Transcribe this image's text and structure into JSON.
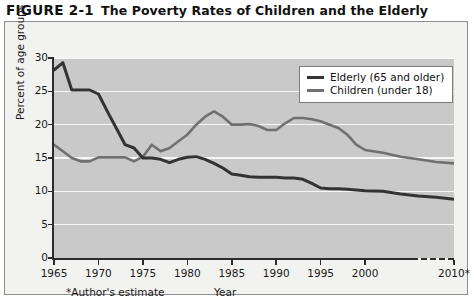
{
  "figure": {
    "number": "FIGURE 2-1",
    "name": "The Poverty Rates of Children and the Elderly"
  },
  "axes": {
    "ylabel": "Percent of age groups",
    "xlabel": "Year",
    "footnote": "*Author's estimate",
    "yticks": [
      "30",
      "25",
      "20",
      "15",
      "10",
      "5",
      "0"
    ],
    "xticks": [
      "1965",
      "1970",
      "1975",
      "1980",
      "1985",
      "1990",
      "1995",
      "2000",
      "2010*"
    ]
  },
  "legend": {
    "items": [
      {
        "label": "Elderly (65 and older)",
        "color": "#333333"
      },
      {
        "label": "Children (under 18)",
        "color": "#707070"
      }
    ]
  },
  "chart_data": {
    "type": "line",
    "title": "The Poverty Rates of Children and the Elderly",
    "xlabel": "Year",
    "ylabel": "Percent of age groups",
    "xlim": [
      1965,
      2010
    ],
    "ylim": [
      0,
      30
    ],
    "ytick_step": 5,
    "grid": "horizontal",
    "legend_position": "top-right",
    "annotations": [
      "*Author's estimate"
    ],
    "x": [
      1965,
      1966,
      1967,
      1968,
      1969,
      1970,
      1971,
      1972,
      1973,
      1974,
      1975,
      1976,
      1977,
      1978,
      1979,
      1980,
      1981,
      1982,
      1983,
      1984,
      1985,
      1986,
      1987,
      1988,
      1989,
      1990,
      1991,
      1992,
      1993,
      1994,
      1995,
      1996,
      1997,
      1998,
      1999,
      2000,
      2002,
      2004,
      2006,
      2008,
      2010
    ],
    "series": [
      {
        "name": "Elderly (65 and older)",
        "color": "#333333",
        "values": [
          28.2,
          29.3,
          25.2,
          25.2,
          25.2,
          24.6,
          22.0,
          19.5,
          17.0,
          16.5,
          15.0,
          15.0,
          14.8,
          14.3,
          14.8,
          15.1,
          15.2,
          14.8,
          14.2,
          13.5,
          12.6,
          12.4,
          12.2,
          12.1,
          12.1,
          12.1,
          12.0,
          12.0,
          11.8,
          11.2,
          10.5,
          10.4,
          10.4,
          10.3,
          10.2,
          10.1,
          10.0,
          9.6,
          9.3,
          9.1,
          8.8
        ]
      },
      {
        "name": "Children (under 18)",
        "color": "#707070",
        "values": [
          17.0,
          16.0,
          15.0,
          14.5,
          14.5,
          15.1,
          15.1,
          15.1,
          15.1,
          14.5,
          15.2,
          17.0,
          16.0,
          16.5,
          17.5,
          18.5,
          20.0,
          21.2,
          22.0,
          21.2,
          20.0,
          20.0,
          20.1,
          19.8,
          19.2,
          19.2,
          20.2,
          21.0,
          21.0,
          20.8,
          20.5,
          20.0,
          19.5,
          18.5,
          17.0,
          16.2,
          15.8,
          15.2,
          14.8,
          14.4,
          14.2
        ]
      }
    ]
  }
}
